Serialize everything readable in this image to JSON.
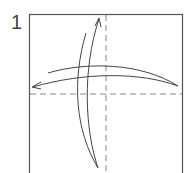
{
  "diagram": {
    "step_number": "1",
    "type": "origami-fold-instruction",
    "elements": [
      {
        "kind": "paper-square",
        "stroke": "#555555"
      },
      {
        "kind": "valley-fold-line",
        "orientation": "vertical",
        "style": "dashed"
      },
      {
        "kind": "valley-fold-line",
        "orientation": "horizontal",
        "style": "dashed"
      },
      {
        "kind": "fold-and-unfold-arrow",
        "direction": "vertical"
      },
      {
        "kind": "fold-and-unfold-arrow",
        "direction": "horizontal"
      }
    ],
    "colors": {
      "line": "#555555",
      "dash": "#888888",
      "background": "#ffffff"
    }
  }
}
